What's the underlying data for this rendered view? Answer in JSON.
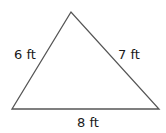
{
  "diagram": {
    "shape": "triangle",
    "stroke_color": "#555555",
    "vertices": {
      "apex": [
        71,
        12
      ],
      "bottom_left": [
        12,
        109
      ],
      "bottom_right": [
        159,
        109
      ]
    },
    "sides": {
      "left": {
        "label": "6 ft"
      },
      "right": {
        "label": "7 ft"
      },
      "bottom": {
        "label": "8 ft"
      }
    }
  }
}
